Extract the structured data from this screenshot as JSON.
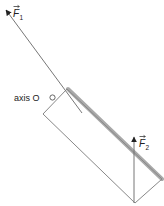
{
  "diagram": {
    "type": "physics-force-diagram",
    "object": "rectangular rod rotating about axis O",
    "axis_label": "axis O",
    "forces": [
      {
        "name": "F1",
        "label_base": "F",
        "label_sub": "1",
        "direction": "up-left, along rod"
      },
      {
        "name": "F2",
        "label_base": "F",
        "label_sub": "2",
        "direction": "vertical up"
      }
    ],
    "colors": {
      "line": "#777777",
      "shadow": "#a9a9a9",
      "arrow": "#222222",
      "text": "#222222"
    }
  }
}
